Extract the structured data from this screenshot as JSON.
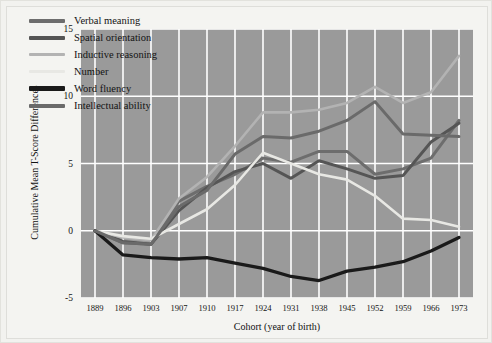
{
  "figure": {
    "background": "#f4f4f1",
    "plot_background": "#9a9a9a",
    "gridline_color": "#ffffff"
  },
  "chart_data": {
    "type": "line",
    "title": "",
    "xlabel": "Cohort (year of birth)",
    "ylabel": "Cumulative Mean T-Score Differences",
    "categories": [
      "1889",
      "1896",
      "1903",
      "1907",
      "1910",
      "1917",
      "1924",
      "1931",
      "1938",
      "1945",
      "1952",
      "1959",
      "1966",
      "1973"
    ],
    "x_tick_labels": [
      "1889",
      "1896",
      "1903",
      "1907",
      "1910",
      "1917",
      "1924",
      "1931",
      "1938",
      "1945",
      "1952",
      "1959",
      "1966",
      "1973"
    ],
    "y_tick_labels": [
      "15",
      "10",
      "5",
      "0",
      "-5"
    ],
    "y_ticks": [
      15,
      10,
      5,
      0,
      -5
    ],
    "ylim": [
      -5,
      15
    ],
    "grid": true,
    "legend_position": "upper-left",
    "series": [
      {
        "name": "Verbal meaning",
        "color": "#6d6d6d",
        "width": 3.0,
        "values": [
          0.0,
          -0.9,
          -1.0,
          2.2,
          3.3,
          4.2,
          5.4,
          5.1,
          5.9,
          5.9,
          4.2,
          4.6,
          5.4,
          8.2
        ]
      },
      {
        "name": "Spatial orientation",
        "color": "#555555",
        "width": 3.0,
        "values": [
          0.0,
          -0.8,
          -1.0,
          1.5,
          3.2,
          4.4,
          5.0,
          3.9,
          5.2,
          4.6,
          3.9,
          4.1,
          6.6,
          8.0
        ]
      },
      {
        "name": "Inductive reasoning",
        "color": "#b3b3b3",
        "width": 2.6,
        "values": [
          0.0,
          -0.5,
          -0.7,
          2.4,
          4.0,
          6.3,
          8.8,
          8.8,
          9.0,
          9.5,
          10.7,
          9.5,
          10.3,
          13.0
        ]
      },
      {
        "name": "Number",
        "color": "#e8e8e4",
        "width": 2.6,
        "values": [
          0.0,
          -0.4,
          -0.6,
          0.5,
          1.6,
          3.4,
          5.8,
          5.0,
          4.2,
          3.8,
          2.6,
          0.9,
          0.8,
          0.3
        ]
      },
      {
        "name": "Word fluency",
        "color": "#1a1a1a",
        "width": 3.3,
        "values": [
          0.0,
          -1.8,
          -2.0,
          -2.1,
          -2.0,
          -2.4,
          -2.8,
          -3.4,
          -3.7,
          -3.0,
          -2.7,
          -2.3,
          -1.5,
          -0.5
        ]
      },
      {
        "name": "Intellectual ability",
        "color": "#6a6a6a",
        "width": 3.0,
        "values": [
          0.0,
          -0.9,
          -1.0,
          1.8,
          3.0,
          5.7,
          7.0,
          6.9,
          7.4,
          8.2,
          9.6,
          7.2,
          7.1,
          7.0
        ]
      }
    ]
  },
  "legend": {
    "items": [
      {
        "label": "Verbal meaning",
        "color": "#6d6d6d",
        "thickness": 4
      },
      {
        "label": "Spatial orientation",
        "color": "#555555",
        "thickness": 4
      },
      {
        "label": "Inductive reasoning",
        "color": "#b3b3b3",
        "thickness": 3
      },
      {
        "label": "Number",
        "color": "#e8e8e4",
        "thickness": 3
      },
      {
        "label": "Word fluency",
        "color": "#1a1a1a",
        "thickness": 5
      },
      {
        "label": "Intellectual ability",
        "color": "#6a6a6a",
        "thickness": 4
      }
    ]
  }
}
